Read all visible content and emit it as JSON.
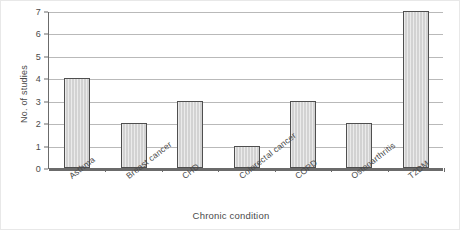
{
  "chart_data": {
    "type": "bar",
    "title": "",
    "xlabel": "Chronic condition",
    "ylabel": "No. of studies",
    "categories": [
      "Asthma",
      "Breast cancer",
      "CHD",
      "Colorectal cancer",
      "COPD",
      "Osteoarthritis",
      "T2DM"
    ],
    "values": [
      4,
      2,
      3,
      1,
      3,
      2,
      7
    ],
    "ylim": [
      0,
      7
    ],
    "ytick_labels": [
      "0",
      "1",
      "2",
      "3",
      "4",
      "5",
      "6",
      "7"
    ],
    "ytick_values": [
      0,
      1,
      2,
      3,
      4,
      5,
      6,
      7
    ],
    "grid": "horizontal",
    "legend": "none",
    "bar_fill_color": "#d2d2d2",
    "bar_edge_color": "#4f4f4f",
    "gridline_color": "#b9b9b9",
    "axis_color": "#6b6b6b",
    "background_color": "#ffffff"
  }
}
